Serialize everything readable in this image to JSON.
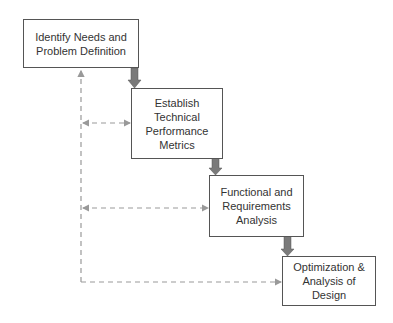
{
  "diagram": {
    "type": "waterfall-process",
    "colors": {
      "box_border": "#555555",
      "arrow": "#7a7a7a",
      "dashed": "#999999",
      "text": "#333333"
    },
    "steps": [
      {
        "label": "Identify Needs and Problem Definition"
      },
      {
        "label": "Establish Technical Performance Metrics"
      },
      {
        "label": "Functional and Requirements Analysis"
      },
      {
        "label": "Optimization & Analysis of Design"
      }
    ],
    "feedback": "dashed arrows from each later step back to the first step"
  }
}
